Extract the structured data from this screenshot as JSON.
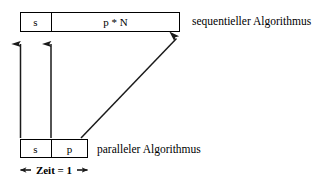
{
  "diagram": {
    "background_color": "#ffffff",
    "stroke_color": "#000000",
    "sequential_bar": {
      "label": "sequentieller Algorithmus",
      "segments": [
        {
          "name": "serial-part",
          "text": "s"
        },
        {
          "name": "parallel-part",
          "text": "p * N"
        }
      ]
    },
    "parallel_bar": {
      "label": "paralleler Algorithmus",
      "segments": [
        {
          "name": "serial-part",
          "text": "s"
        },
        {
          "name": "parallel-part",
          "text": "p"
        }
      ]
    },
    "measure": {
      "text": "Zeit = 1"
    },
    "arrows": [
      {
        "name": "serial-start-arrow",
        "direction": "up"
      },
      {
        "name": "serial-end-arrow",
        "direction": "up"
      },
      {
        "name": "parallel-expansion-arrow",
        "direction": "up-right"
      },
      {
        "name": "time-span-arrow",
        "direction": "bidirectional-horizontal"
      }
    ]
  }
}
